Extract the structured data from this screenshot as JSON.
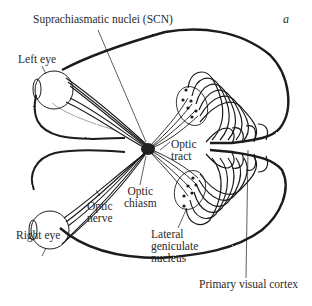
{
  "figure": {
    "panel_letter": "a"
  },
  "labels": {
    "scn": "Suprachiasmatic nuclei (SCN)",
    "left_eye": "Left eye",
    "right_eye": "Right eye",
    "optic_tract_1": "Optic",
    "optic_tract_2": "tract",
    "optic_chiasm_1": "Optic",
    "optic_chiasm_2": "chiasm",
    "optic_nerve_1": "Optic",
    "optic_nerve_2": "nerve",
    "lgn_1": "Lateral",
    "lgn_2": "geniculate",
    "lgn_3": "nucleus",
    "v1": "Primary visual cortex"
  },
  "colors": {
    "ink": "#1a1a1a",
    "background": "#ffffff"
  }
}
